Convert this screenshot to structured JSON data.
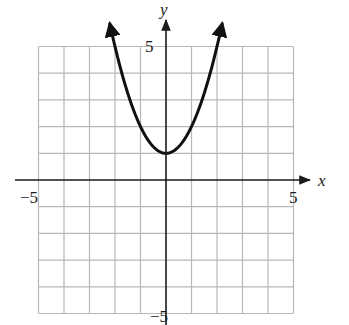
{
  "chart_data": {
    "type": "line",
    "title": "",
    "function": "y = x^2 + 1",
    "xlabel": "x",
    "ylabel": "y",
    "xlim": [
      -5,
      5
    ],
    "ylim": [
      -5,
      5
    ],
    "grid": true,
    "grid_step": 1,
    "tick_labels": {
      "x_min": "−5",
      "x_max": "5",
      "y_max": "5",
      "y_min": "−5"
    },
    "series": [
      {
        "name": "parabola",
        "x": [
          -2.28,
          -2,
          -1.5,
          -1,
          -0.5,
          0,
          0.5,
          1,
          1.5,
          2,
          2.23
        ],
        "y": [
          6.2,
          5,
          3.25,
          2,
          1.25,
          1,
          1.25,
          2,
          3.25,
          5,
          6.0
        ],
        "vertex": [
          0,
          1
        ],
        "arrows_at_ends": true
      }
    ],
    "legend": null
  },
  "colors": {
    "grid": "#b8b8b8",
    "axis": "#1a1a1a",
    "curve": "#111111",
    "background": "#ffffff"
  }
}
